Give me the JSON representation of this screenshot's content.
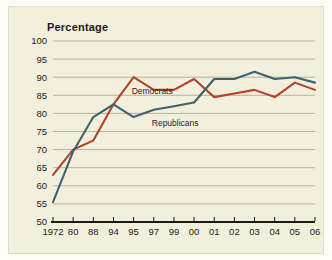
{
  "figure": {
    "background_color": "#f3efdd",
    "border_color": "#e2dcc4"
  },
  "chart_data": {
    "type": "line",
    "title": "Percentage",
    "subtitle": "",
    "xlabel": "",
    "ylabel": "Percentage",
    "ylim": [
      50,
      100
    ],
    "xlim_categories_evenly_spaced": true,
    "grid": "horizontal",
    "legend_position": "inline-labels",
    "categories": [
      "1972",
      "80",
      "88",
      "94",
      "95",
      "97",
      "99",
      "00",
      "01",
      "02",
      "03",
      "04",
      "05",
      "06"
    ],
    "y_ticks": [
      50,
      55,
      60,
      65,
      70,
      75,
      80,
      85,
      90,
      95,
      100
    ],
    "y_tick_labels": [
      "50",
      "55",
      "60",
      "65",
      "70",
      "75",
      "80",
      "85",
      "90",
      "95",
      "100"
    ],
    "x_tick_labels": [
      "1972",
      "80",
      "88",
      "94",
      "95",
      "97",
      "99",
      "00",
      "01",
      "02",
      "03",
      "04",
      "05",
      "06"
    ],
    "series": [
      {
        "name": "Democrats",
        "color": "#b5432c",
        "label_text": "Democrats",
        "values": [
          63,
          70,
          72.5,
          82.5,
          90,
          86.5,
          86.5,
          89.5,
          84.5,
          85.5,
          86.5,
          84.5,
          88.5,
          86.5
        ]
      },
      {
        "name": "Republicans",
        "color": "#3d6272",
        "label_text": "Republicans",
        "values": [
          55.5,
          69.5,
          79,
          82.5,
          79,
          81,
          82,
          83,
          89.5,
          89.5,
          91.5,
          89.5,
          90,
          88.5
        ]
      }
    ],
    "annotations": [
      {
        "text": "Democrats",
        "series": "Democrats"
      },
      {
        "text": "Republicans",
        "series": "Republicans"
      }
    ]
  }
}
